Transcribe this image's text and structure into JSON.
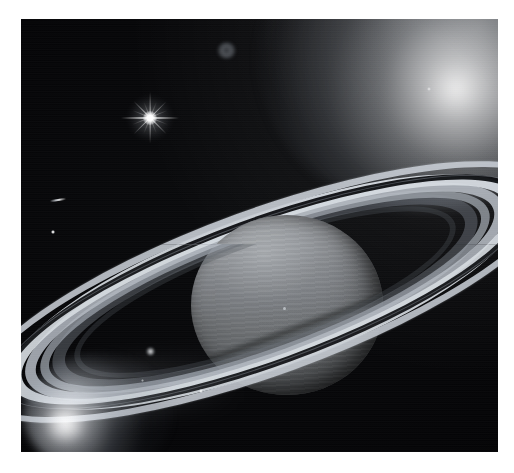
{
  "image": {
    "subject": "Saturn",
    "kind": "astronomical-photograph",
    "palette": "grayscale",
    "frame": {
      "canvas_width": 514,
      "canvas_height": 473,
      "margin_color": "#ffffff",
      "photo_left": 21,
      "photo_top": 19,
      "photo_width": 477,
      "photo_height": 433,
      "background_color": "#030304"
    },
    "objects": [
      {
        "name": "saturn-planet",
        "label": "Saturn globe",
        "center_x": 266,
        "center_y": 286,
        "radius_x": 96,
        "radius_y": 90,
        "highlight_color": "#9a9da1",
        "shadow_color": "#55585b"
      },
      {
        "name": "saturn-rings",
        "label": "Ring system",
        "tilt_degrees": -20,
        "outer_width": 600,
        "outer_height": 152,
        "bands": [
          {
            "name": "A ring",
            "brightness": "#c4cad1"
          },
          {
            "name": "Cassini Division",
            "brightness": "#0e0f12"
          },
          {
            "name": "B ring outer",
            "brightness": "#d6dbe1"
          },
          {
            "name": "B ring mid",
            "brightness": "#b2b8c0"
          },
          {
            "name": "B ring inner",
            "brightness": "#969ca4"
          },
          {
            "name": "C ring",
            "brightness": "#686e76"
          }
        ]
      },
      {
        "name": "bright-star",
        "label": "Bright diffraction-spike star",
        "center_x": 150,
        "center_y": 118,
        "color": "#ffffff"
      },
      {
        "name": "faint-ring-object",
        "label": "Faint diffuse ring-shaped object",
        "center_x": 205,
        "center_y": 31,
        "color": "#aab2bc"
      },
      {
        "name": "moon-dot",
        "label": "Small moon point source",
        "center_x": 53,
        "center_y": 232,
        "color": "#ffffff"
      },
      {
        "name": "streak-artifact",
        "label": "Elongated streak artifact",
        "center_x": 58,
        "center_y": 200,
        "color": "#e6ecf4"
      },
      {
        "name": "glow-upper-right",
        "label": "Diffuse glow, upper-right corner",
        "center_x": 492,
        "center_y": 30,
        "color": "#ffffff"
      },
      {
        "name": "glow-bottom-left",
        "label": "Bright diffuse glow, lower-left",
        "center_x": 55,
        "center_y": 435,
        "color": "#ffffff"
      },
      {
        "name": "ring-knot",
        "label": "Bright knot on left ring ansa",
        "center_x": 150,
        "center_y": 352,
        "color": "#ffffff"
      }
    ]
  },
  "caption": {
    "text": "Saturn"
  }
}
